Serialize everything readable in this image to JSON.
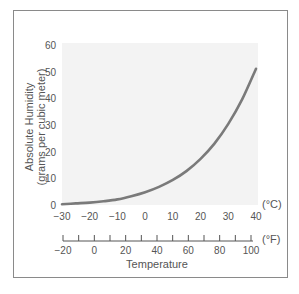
{
  "chart_data": {
    "type": "line",
    "title": "",
    "xlabel": "Temperature",
    "ylabel": "Absolute Humidity (grams per cubic meter)",
    "ylabel_line1": "Absolute Humidity",
    "ylabel_line2": "(grams per cubic meter)",
    "x_unit_primary": "(°C)",
    "x_unit_secondary": "(°F)",
    "xlim": [
      -30,
      40
    ],
    "ylim": [
      0,
      60
    ],
    "grid": false,
    "legend": null,
    "x_ticks_celsius": [
      -30,
      -20,
      -10,
      0,
      10,
      20,
      30,
      40
    ],
    "x_ticks_fahrenheit_labels": [
      -20,
      0,
      20,
      40,
      60,
      80,
      100
    ],
    "x_ticks_fahrenheit_minor_step": 10,
    "y_ticks": [
      0,
      10,
      20,
      30,
      40,
      50,
      60
    ],
    "series": [
      {
        "name": "Saturation absolute humidity",
        "x": [
          -30,
          -25,
          -20,
          -15,
          -10,
          -5,
          0,
          5,
          10,
          15,
          20,
          25,
          30,
          35,
          40
        ],
        "values": [
          0.3,
          0.6,
          0.9,
          1.4,
          2.1,
          3.3,
          4.8,
          6.8,
          9.4,
          12.8,
          17.3,
          23.0,
          30.4,
          39.6,
          51.1
        ]
      }
    ]
  },
  "colors": {
    "curve": "#7a7a7a",
    "plot_background": "#f3f3f3",
    "text": "#555555",
    "frame": "#8a8a8a"
  },
  "labels": {
    "y_title_1": "Absolute Humidity",
    "y_title_2": "(grams per cubic meter)",
    "x_title": "Temperature",
    "celsius_unit": "(°C)",
    "fahrenheit_unit": "(°F)",
    "y_tick_labels": [
      "0",
      "10",
      "20",
      "30",
      "40",
      "50",
      "60"
    ],
    "c_tick_labels": [
      "−30",
      "−20",
      "−10",
      "0",
      "10",
      "20",
      "30",
      "40"
    ],
    "f_tick_labels": [
      "−20",
      "0",
      "20",
      "40",
      "60",
      "80",
      "100"
    ]
  }
}
